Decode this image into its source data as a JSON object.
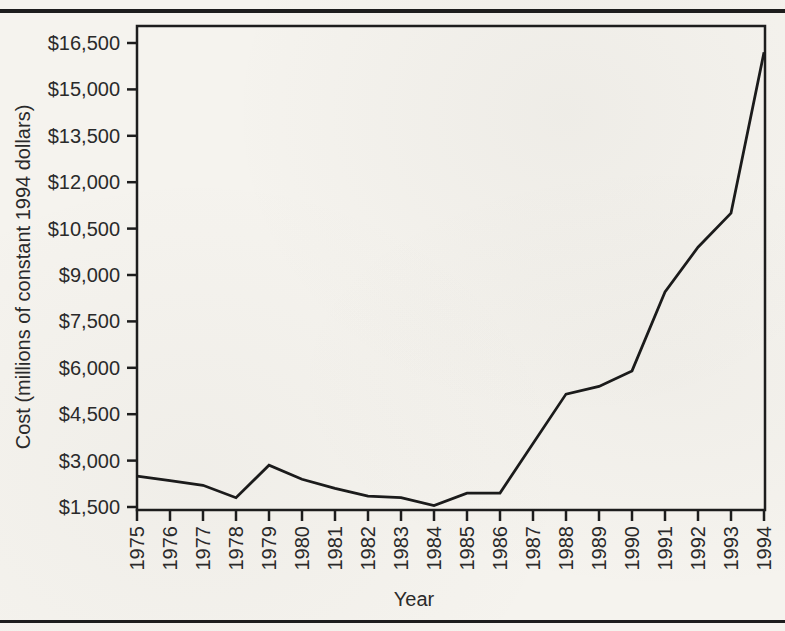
{
  "page": {
    "background": "#f5f3ee",
    "rule_color": "#1d1d1d",
    "text_color": "#2a2a2a",
    "line_color": "#1b1b1b"
  },
  "chart_data": {
    "type": "line",
    "title": "",
    "xlabel": "Year",
    "ylabel": "Cost (millions of constant 1994 dollars)",
    "x": [
      1975,
      1976,
      1977,
      1978,
      1979,
      1980,
      1981,
      1982,
      1983,
      1984,
      1985,
      1986,
      1987,
      1988,
      1989,
      1990,
      1991,
      1992,
      1993,
      1994
    ],
    "xtick_labels": [
      "1975",
      "1976",
      "1977",
      "1978",
      "1979",
      "1980",
      "1981",
      "1982",
      "1983",
      "1984",
      "1985",
      "1986",
      "1987",
      "1988",
      "1989",
      "1990",
      "1991",
      "1992",
      "1993",
      "1994"
    ],
    "values": [
      2500,
      2350,
      2200,
      1800,
      2850,
      2400,
      2100,
      1850,
      1800,
      1550,
      1950,
      1950,
      3550,
      5150,
      5400,
      5900,
      8450,
      9900,
      11000,
      16200
    ],
    "ylim": [
      1500,
      16500
    ],
    "ytick_values": [
      1500,
      3000,
      4500,
      6000,
      7500,
      9000,
      10500,
      12000,
      13500,
      15000,
      16500
    ],
    "ytick_labels": [
      "$1,500",
      "$3,000",
      "$4,500",
      "$6,000",
      "$7,500",
      "$9,000",
      "$10,500",
      "$12,000",
      "$13,500",
      "$15,000",
      "$16,500"
    ],
    "grid": false,
    "legend": false
  }
}
